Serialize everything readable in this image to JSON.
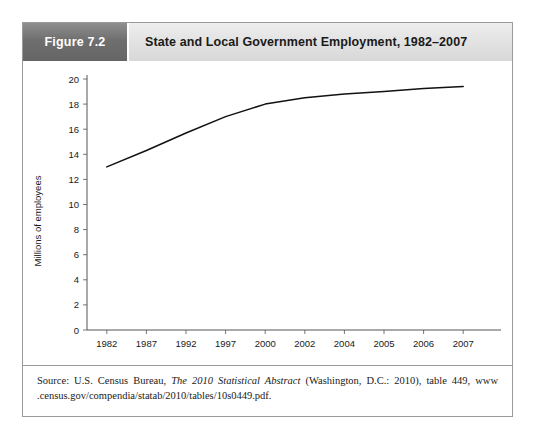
{
  "figure": {
    "number_label": "Figure 7.2",
    "title": "State and Local Government Employment, 1982–2007",
    "source_prefix": "Source: U.S. Census Bureau, ",
    "source_italic": "The 2010 Statistical Abstract",
    "source_suffix": " (Washington, D.C.: 2010), table 449, www .census.gov/compendia/statab/2010/tables/10s0449.pdf."
  },
  "chart_data": {
    "type": "line",
    "title": "State and Local Government Employment, 1982–2007",
    "xlabel": "",
    "ylabel": "Millions of employees",
    "categories": [
      "1982",
      "1987",
      "1992",
      "1997",
      "2000",
      "2002",
      "2004",
      "2005",
      "2006",
      "2007"
    ],
    "values": [
      13.0,
      14.3,
      15.7,
      17.0,
      18.0,
      18.5,
      18.8,
      19.0,
      19.25,
      19.4
    ],
    "series": [
      {
        "name": "State and local government employment",
        "values": [
          13.0,
          14.3,
          15.7,
          17.0,
          18.0,
          18.5,
          18.8,
          19.0,
          19.25,
          19.4
        ]
      }
    ],
    "ylim": [
      0,
      20
    ],
    "yticks": [
      0,
      2,
      4,
      6,
      8,
      10,
      12,
      14,
      16,
      18,
      20
    ],
    "ytick_labels": [
      "0",
      "2",
      "4",
      "6",
      "8",
      "10",
      "12",
      "14",
      "16",
      "18",
      "20"
    ],
    "xtick_labels": [
      "1982",
      "1987",
      "1992",
      "1997",
      "2000",
      "2002",
      "2004",
      "2005",
      "2006",
      "2007"
    ],
    "grid": false,
    "legend": false,
    "line_color": "#111111",
    "axis_color": "#555555"
  }
}
